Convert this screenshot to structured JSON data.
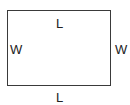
{
  "diagram": {
    "shape": "rectangle",
    "labels": {
      "top": "L",
      "bottom": "L",
      "left": "W",
      "right": "W"
    },
    "stroke_color": "#3a3a3a"
  }
}
